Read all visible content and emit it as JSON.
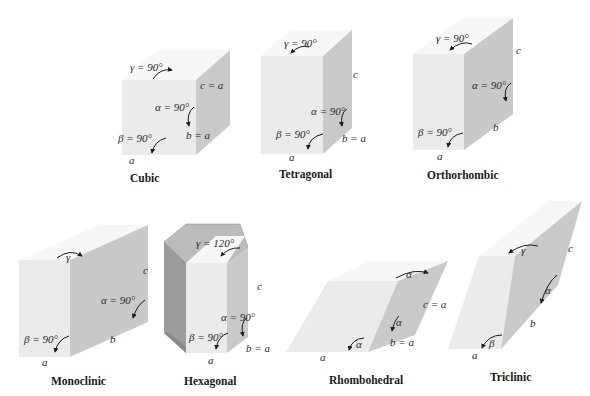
{
  "diagram": {
    "systems": [
      {
        "name": "Cubic",
        "labels": {
          "gamma": "γ = 90°",
          "alpha": "α = 90°",
          "beta": "β = 90°",
          "a": "a",
          "b": "b = a",
          "c": "c = a"
        }
      },
      {
        "name": "Tetragonal",
        "labels": {
          "gamma": "γ = 90°",
          "alpha": "α = 90°",
          "beta": "β = 90°",
          "a": "a",
          "b": "b = a",
          "c": "c"
        }
      },
      {
        "name": "Orthorhombic",
        "labels": {
          "gamma": "γ = 90°",
          "alpha": "α = 90°",
          "beta": "β = 90°",
          "a": "a",
          "b": "b",
          "c": "c"
        }
      },
      {
        "name": "Monoclinic",
        "labels": {
          "gamma": "γ",
          "alpha": "α = 90°",
          "beta": "β = 90°",
          "a": "a",
          "b": "b",
          "c": "c"
        }
      },
      {
        "name": "Hexagonal",
        "labels": {
          "gamma": "γ = 120°",
          "alpha": "α = 90°",
          "beta": "β = 90°",
          "a": "a",
          "b": "b = a",
          "c": "c"
        }
      },
      {
        "name": "Rhombohedral",
        "labels": {
          "gamma": "α",
          "alpha": "α",
          "beta": "α",
          "a": "a",
          "b": "b = a",
          "c": "c = a"
        }
      },
      {
        "name": "Triclinic",
        "labels": {
          "gamma": "γ",
          "alpha": "α",
          "beta": "β",
          "a": "a",
          "b": "b",
          "c": "c"
        }
      }
    ]
  },
  "colors": {
    "front": "#ebebeb",
    "top": "#f7f7f7",
    "side": "#c9c9c9",
    "dark": "#9a9a9a",
    "text": "#1a1a1a"
  }
}
